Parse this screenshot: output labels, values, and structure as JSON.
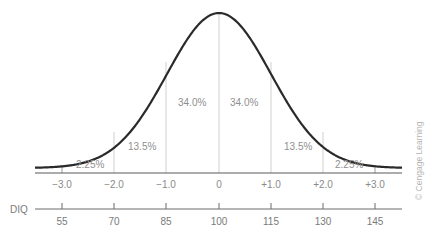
{
  "chart_data": {
    "type": "line",
    "title": "",
    "x": [
      -3.0,
      -2.0,
      -1.0,
      0,
      1.0,
      2.0,
      3.0
    ],
    "x_tick_labels": [
      "−3.0",
      "−2.0",
      "−1.0",
      "0",
      "+1.0",
      "+2.0",
      "+3.0"
    ],
    "secondary_axis": {
      "label": "DIQ",
      "tick_labels": [
        "55",
        "70",
        "85",
        "100",
        "115",
        "130",
        "145"
      ],
      "values": [
        55,
        70,
        85,
        100,
        115,
        130,
        145
      ]
    },
    "regions": [
      {
        "range": [
          -3.0,
          -2.0
        ],
        "percent": "2.25%"
      },
      {
        "range": [
          -2.0,
          -1.0
        ],
        "percent": "13.5%"
      },
      {
        "range": [
          -1.0,
          0
        ],
        "percent": "34.0%"
      },
      {
        "range": [
          0,
          1.0
        ],
        "percent": "34.0%"
      },
      {
        "range": [
          1.0,
          2.0
        ],
        "percent": "13.5%"
      },
      {
        "range": [
          2.0,
          3.0
        ],
        "percent": "2.25%"
      }
    ],
    "xlabel": "",
    "ylabel": "",
    "grid": false,
    "legend": null
  },
  "labels": {
    "pct": [
      "2.25%",
      "13.5%",
      "34.0%",
      "34.0%",
      "13.5%",
      "2.25%"
    ],
    "sd": [
      "−3.0",
      "−2.0",
      "−1.0",
      "0",
      "+1.0",
      "+2.0",
      "+3.0"
    ],
    "diq_title": "DIQ",
    "diq": [
      "55",
      "70",
      "85",
      "100",
      "115",
      "130",
      "145"
    ]
  },
  "credit": "© Cengage Learning"
}
